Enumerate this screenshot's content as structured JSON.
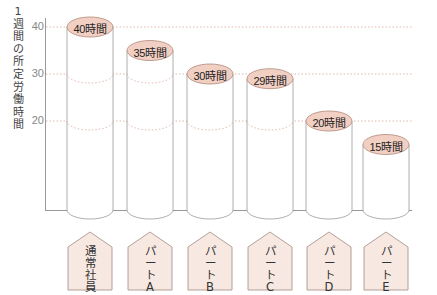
{
  "chart_data": {
    "type": "bar",
    "style": "cylinder",
    "title": "",
    "ylabel": "1週間の所定労働時間",
    "xlabel": "",
    "ylim": [
      0,
      40
    ],
    "yticks": [
      20,
      30,
      40
    ],
    "grid": "dotted lines at 20, 30, 40",
    "categories": [
      "通常社員",
      "パートA",
      "パートB",
      "パートC",
      "パートD",
      "パートE"
    ],
    "values": [
      40,
      35,
      30,
      29,
      20,
      15
    ],
    "value_labels": [
      "40時間",
      "35時間",
      "30時間",
      "29時間",
      "20時間",
      "15時間"
    ],
    "unit": "時間"
  },
  "axis": {
    "ylabel_chars": [
      "1",
      "週",
      "間",
      "の",
      "所",
      "定",
      "労",
      "働",
      "時",
      "間"
    ],
    "ticks": [
      "40",
      "30",
      "20"
    ]
  },
  "bars": [
    {
      "category": "通常社員",
      "tag_chars": [
        "通",
        "常",
        "社",
        "員"
      ],
      "value": 40,
      "label": "40時間"
    },
    {
      "category": "パートA",
      "tag_chars": [
        "パ",
        "ー",
        "ト",
        "A"
      ],
      "value": 35,
      "label": "35時間"
    },
    {
      "category": "パートB",
      "tag_chars": [
        "パ",
        "ー",
        "ト",
        "B"
      ],
      "value": 30,
      "label": "30時間"
    },
    {
      "category": "パートC",
      "tag_chars": [
        "パ",
        "ー",
        "ト",
        "C"
      ],
      "value": 29,
      "label": "29時間"
    },
    {
      "category": "パートD",
      "tag_chars": [
        "パ",
        "ー",
        "ト",
        "D"
      ],
      "value": 20,
      "label": "20時間"
    },
    {
      "category": "パートE",
      "tag_chars": [
        "パ",
        "ー",
        "ト",
        "E"
      ],
      "value": 15,
      "label": "15時間"
    }
  ],
  "colors": {
    "label_fill": "#f2cfc3",
    "label_stroke": "#b08878",
    "tag_fill": "#f8e8e2",
    "tag_stroke": "#a08a80",
    "line": "#999999",
    "grid": "#d9a79a"
  }
}
